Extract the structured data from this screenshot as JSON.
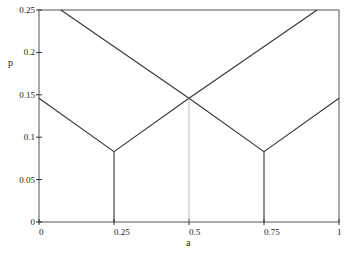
{
  "chart_data": {
    "type": "line",
    "title": "",
    "xlabel": "a",
    "ylabel": "p",
    "xlim": [
      0,
      1
    ],
    "ylim": [
      0,
      0.25
    ],
    "grid": false,
    "x_ticks": [
      "0",
      "0.25",
      "0.5",
      "0.75",
      "1"
    ],
    "y_ticks": [
      "0",
      "0.05",
      "0.1",
      "0.15",
      "0.2",
      "0.25"
    ],
    "series": [
      {
        "name": "left-V",
        "x": [
          0,
          0.25,
          0.5
        ],
        "values": [
          0.146,
          0.083,
          0.146
        ]
      },
      {
        "name": "right-V",
        "x": [
          0.5,
          0.75,
          1
        ],
        "values": [
          0.146,
          0.083,
          0.146
        ]
      },
      {
        "name": "descending",
        "x": [
          0.073,
          0.5
        ],
        "values": [
          0.25,
          0.146
        ]
      },
      {
        "name": "ascending",
        "x": [
          0.5,
          0.927
        ],
        "values": [
          0.146,
          0.25
        ]
      }
    ],
    "vertical_lines": [
      {
        "x": 0.25,
        "from": 0,
        "to": 0.083,
        "style": "solid"
      },
      {
        "x": 0.5,
        "from": 0,
        "to": 0.146,
        "style": "light"
      },
      {
        "x": 0.75,
        "from": 0,
        "to": 0.083,
        "style": "solid"
      }
    ]
  }
}
